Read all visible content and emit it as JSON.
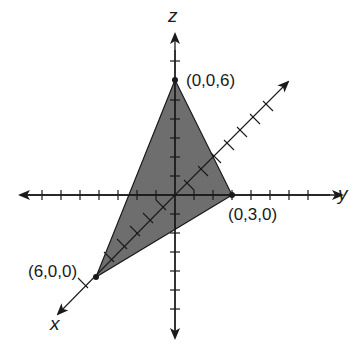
{
  "diagram": {
    "type": "3d-coordinate-plane-triangle",
    "axes": {
      "x": {
        "label": "x"
      },
      "y": {
        "label": "y"
      },
      "z": {
        "label": "z"
      }
    },
    "points": [
      {
        "label": "(0,0,6)",
        "coords": [
          0,
          0,
          6
        ]
      },
      {
        "label": "(0,3,0)",
        "coords": [
          0,
          3,
          0
        ]
      },
      {
        "label": "(6,0,0)",
        "coords": [
          6,
          0,
          0
        ]
      }
    ],
    "colors": {
      "fill": "#6e6e6e",
      "stroke": "#1a1a1a",
      "background": "#ffffff"
    }
  }
}
